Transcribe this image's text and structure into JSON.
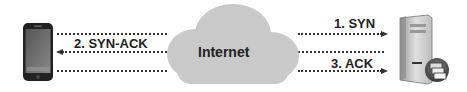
{
  "diagram": {
    "nodes": [
      {
        "id": "client",
        "icon": "smartphone-icon"
      },
      {
        "id": "network",
        "label": "Internet",
        "icon": "cloud-icon"
      },
      {
        "id": "server",
        "icon": "server-icon"
      }
    ],
    "messages": [
      {
        "label": "1. SYN",
        "from": "client",
        "to": "server",
        "direction": "right"
      },
      {
        "label": "2. SYN-ACK",
        "from": "server",
        "to": "client",
        "direction": "left"
      },
      {
        "label": "3. ACK",
        "from": "client",
        "to": "server",
        "direction": "right"
      }
    ]
  }
}
